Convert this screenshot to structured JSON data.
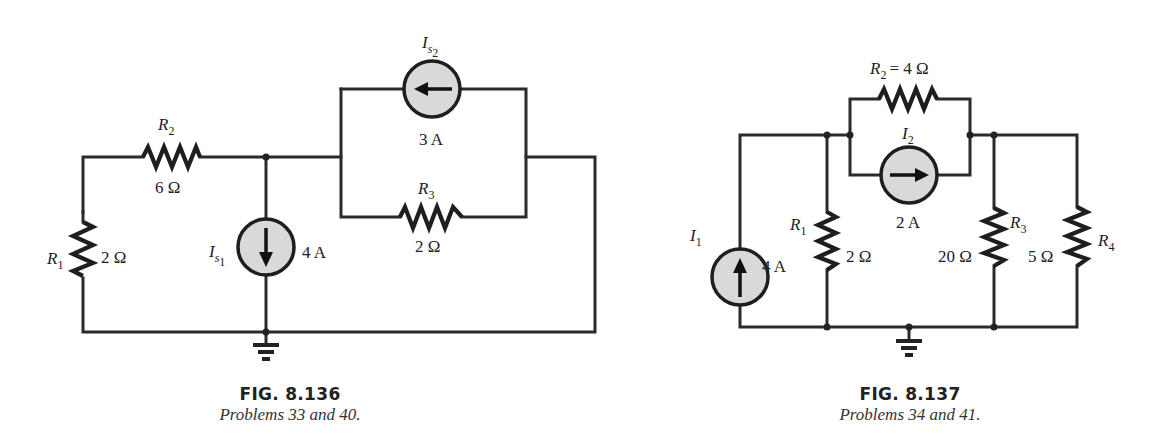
{
  "figures": [
    {
      "id": "fig-8-136",
      "caption_title": "FIG. 8.136",
      "caption_subtitle": "Problems 33 and 40.",
      "components": {
        "R1": {
          "name": "R",
          "sub": "1",
          "value": "2 Ω"
        },
        "R2": {
          "name": "R",
          "sub": "2",
          "value": "6 Ω"
        },
        "R3": {
          "name": "R",
          "sub": "3",
          "value": "2 Ω"
        },
        "Is1": {
          "name": "I",
          "sub": "s",
          "subsub": "1",
          "value": "4 A",
          "direction": "down"
        },
        "Is2": {
          "name": "I",
          "sub": "s",
          "subsub": "2",
          "value": "3 A",
          "direction": "left"
        }
      },
      "ground": "ground-symbol"
    },
    {
      "id": "fig-8-137",
      "caption_title": "FIG. 8.137",
      "caption_subtitle": "Problems 34 and 41.",
      "components": {
        "R1": {
          "name": "R",
          "sub": "1",
          "value": "2 Ω"
        },
        "R2": {
          "name": "R",
          "sub": "2",
          "eq": "= 4 Ω"
        },
        "R3": {
          "name": "R",
          "sub": "3",
          "value": "20 Ω"
        },
        "R4": {
          "name": "R",
          "sub": "4",
          "value": "5 Ω"
        },
        "I1": {
          "name": "I",
          "sub": "1",
          "value": "4 A",
          "direction": "up"
        },
        "I2": {
          "name": "I",
          "sub": "2",
          "value": "2 A",
          "direction": "right"
        }
      },
      "ground": "ground-symbol"
    }
  ],
  "colors": {
    "wire": "#2b2b2b",
    "source_fill": "#d9d9d9",
    "background": "#ffffff"
  }
}
